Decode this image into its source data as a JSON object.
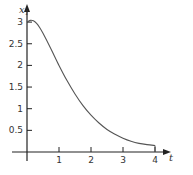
{
  "chart_data": {
    "type": "line",
    "title": "",
    "xlabel": "t",
    "ylabel": "x1",
    "ylabel_main": "x",
    "ylabel_sub": "1",
    "xlim": [
      0,
      4.4
    ],
    "ylim": [
      0,
      3.3
    ],
    "grid": false,
    "legend": null,
    "x_ticks": [
      1,
      2,
      3,
      4
    ],
    "x_tick_labels": [
      "1",
      "2",
      "3",
      "4"
    ],
    "y_ticks": [
      0.5,
      1,
      1.5,
      2,
      2.5,
      3
    ],
    "y_tick_labels": [
      "0.5",
      "1",
      "1.5",
      "2",
      "2.5",
      "3"
    ],
    "series": [
      {
        "name": "x1(t)",
        "color": "#555555",
        "x": [
          0,
          0.1,
          0.2,
          0.3,
          0.4,
          0.5,
          0.75,
          1.0,
          1.25,
          1.5,
          1.75,
          2.0,
          2.25,
          2.5,
          2.75,
          3.0,
          3.25,
          3.5,
          3.75,
          4.0
        ],
        "y": [
          3.0,
          3.04,
          3.03,
          2.97,
          2.87,
          2.74,
          2.38,
          2.0,
          1.65,
          1.34,
          1.07,
          0.85,
          0.67,
          0.52,
          0.41,
          0.32,
          0.25,
          0.2,
          0.17,
          0.15
        ]
      }
    ]
  }
}
